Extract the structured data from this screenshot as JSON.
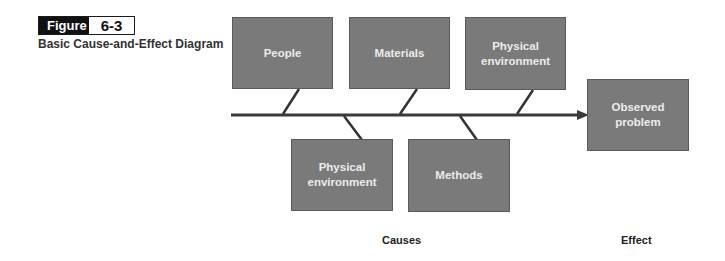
{
  "figure": {
    "tag": "Figure",
    "number": "6-3",
    "caption": "Basic Cause-and-Effect Diagram"
  },
  "causes_top": [
    {
      "label": "People"
    },
    {
      "label": "Materials"
    },
    {
      "label": "Physical environment"
    }
  ],
  "causes_bottom": [
    {
      "label": "Physical environment"
    },
    {
      "label": "Methods"
    }
  ],
  "effect": {
    "label": "Observed problem"
  },
  "axis_labels": {
    "causes": "Causes",
    "effect": "Effect"
  },
  "colors": {
    "box_fill": "#7a7a7a",
    "box_text": "#ececec",
    "line": "#333333"
  }
}
